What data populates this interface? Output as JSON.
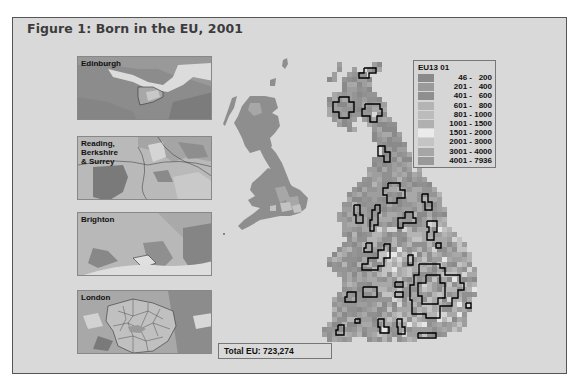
{
  "figure": {
    "title": "Figure 1: Born in the EU, 2001"
  },
  "insets": [
    {
      "label": "Edinburgh",
      "top": 56
    },
    {
      "label": "Reading,\nBerkshire\n& Surrey",
      "top": 136
    },
    {
      "label": "Brighton",
      "top": 212
    },
    {
      "label": "London",
      "top": 290
    }
  ],
  "legend": {
    "title": "EU13 01",
    "classes": [
      {
        "label": "46 -   200",
        "color": "#8a8a8a"
      },
      {
        "label": "201 -   400",
        "color": "#9a9a9a"
      },
      {
        "label": "401 -   600",
        "color": "#8f8f8f"
      },
      {
        "label": "601 -   800",
        "color": "#b4b4b4"
      },
      {
        "label": "801 - 1000",
        "color": "#bcbcbc"
      },
      {
        "label": "1001 - 1500",
        "color": "#b0b0b0"
      },
      {
        "label": "1501 - 2000",
        "color": "#ebebeb"
      },
      {
        "label": "2001 - 3000",
        "color": "#c4c4c4"
      },
      {
        "label": "3001 - 4000",
        "color": "#a6a6a6"
      },
      {
        "label": "4001 - 7936",
        "color": "#999999"
      }
    ]
  },
  "total": {
    "label": "Total EU: 723,274"
  },
  "cartogram": {
    "cell": 5,
    "rows": [
      [
        62,
        337,
        342
      ],
      [
        62,
        372,
        382
      ],
      [
        67,
        337,
        342
      ],
      [
        67,
        352,
        357
      ],
      [
        67,
        367,
        382
      ],
      [
        72,
        332,
        337
      ],
      [
        72,
        347,
        367
      ],
      [
        77,
        327,
        337
      ],
      [
        77,
        342,
        372
      ],
      [
        82,
        342,
        372
      ],
      [
        87,
        342,
        372
      ],
      [
        92,
        332,
        377
      ],
      [
        97,
        327,
        382
      ],
      [
        102,
        327,
        387
      ],
      [
        107,
        327,
        387
      ],
      [
        112,
        327,
        372
      ],
      [
        112,
        377,
        387
      ],
      [
        117,
        332,
        357
      ],
      [
        117,
        362,
        392
      ],
      [
        122,
        337,
        352
      ],
      [
        122,
        367,
        397
      ],
      [
        127,
        347,
        357
      ],
      [
        127,
        372,
        397
      ],
      [
        132,
        372,
        402
      ],
      [
        137,
        372,
        402
      ],
      [
        142,
        377,
        407
      ],
      [
        147,
        382,
        407
      ],
      [
        152,
        382,
        412
      ],
      [
        157,
        372,
        412
      ],
      [
        162,
        372,
        412
      ],
      [
        167,
        367,
        412
      ],
      [
        167,
        417,
        422
      ],
      [
        172,
        367,
        422
      ],
      [
        177,
        362,
        427
      ],
      [
        182,
        357,
        432
      ],
      [
        187,
        352,
        437
      ],
      [
        192,
        347,
        442
      ],
      [
        197,
        347,
        442
      ],
      [
        202,
        342,
        442
      ],
      [
        207,
        342,
        447
      ],
      [
        212,
        337,
        447
      ],
      [
        217,
        337,
        447
      ],
      [
        222,
        342,
        447
      ],
      [
        227,
        342,
        452
      ],
      [
        232,
        342,
        457
      ],
      [
        237,
        347,
        462
      ],
      [
        242,
        342,
        467
      ],
      [
        247,
        337,
        467
      ],
      [
        252,
        332,
        472
      ],
      [
        257,
        327,
        472
      ],
      [
        262,
        327,
        472
      ],
      [
        267,
        332,
        477
      ],
      [
        272,
        337,
        477
      ],
      [
        277,
        342,
        477
      ],
      [
        282,
        342,
        477
      ],
      [
        287,
        342,
        477
      ],
      [
        292,
        337,
        477
      ],
      [
        297,
        332,
        472
      ],
      [
        302,
        332,
        472
      ],
      [
        307,
        332,
        472
      ],
      [
        312,
        332,
        467
      ],
      [
        317,
        332,
        467
      ],
      [
        322,
        327,
        467
      ],
      [
        327,
        322,
        462
      ],
      [
        332,
        322,
        447
      ],
      [
        337,
        327,
        352
      ],
      [
        337,
        367,
        417
      ]
    ],
    "outlines": [
      [
        [
          364,
          68
        ],
        [
          376,
          68
        ],
        [
          376,
          73
        ],
        [
          369,
          73
        ],
        [
          369,
          78
        ],
        [
          359,
          78
        ],
        [
          359,
          73
        ],
        [
          364,
          73
        ],
        [
          364,
          68
        ]
      ],
      [
        [
          339,
          97
        ],
        [
          349,
          97
        ],
        [
          349,
          102
        ],
        [
          354,
          102
        ],
        [
          354,
          112
        ],
        [
          349,
          112
        ],
        [
          349,
          118
        ],
        [
          339,
          118
        ],
        [
          339,
          112
        ],
        [
          333,
          112
        ],
        [
          333,
          102
        ],
        [
          339,
          102
        ],
        [
          339,
          97
        ]
      ],
      [
        [
          365,
          104
        ],
        [
          380,
          104
        ],
        [
          380,
          109
        ],
        [
          382,
          109
        ],
        [
          382,
          116
        ],
        [
          377,
          116
        ],
        [
          377,
          122
        ],
        [
          370,
          122
        ],
        [
          370,
          116
        ],
        [
          362,
          116
        ],
        [
          362,
          109
        ],
        [
          365,
          109
        ],
        [
          365,
          104
        ]
      ],
      [
        [
          378,
          146
        ],
        [
          385,
          146
        ],
        [
          385,
          152
        ],
        [
          390,
          152
        ],
        [
          390,
          162
        ],
        [
          384,
          162
        ],
        [
          384,
          156
        ],
        [
          378,
          156
        ],
        [
          378,
          146
        ]
      ],
      [
        [
          388,
          183
        ],
        [
          400,
          183
        ],
        [
          400,
          190
        ],
        [
          405,
          190
        ],
        [
          405,
          198
        ],
        [
          397,
          198
        ],
        [
          397,
          203
        ],
        [
          387,
          203
        ],
        [
          387,
          195
        ],
        [
          383,
          195
        ],
        [
          383,
          188
        ],
        [
          388,
          188
        ],
        [
          388,
          183
        ]
      ],
      [
        [
          422,
          194
        ],
        [
          428,
          194
        ],
        [
          428,
          202
        ],
        [
          432,
          202
        ],
        [
          432,
          210
        ],
        [
          425,
          210
        ],
        [
          425,
          202
        ],
        [
          422,
          202
        ],
        [
          422,
          194
        ]
      ],
      [
        [
          354,
          205
        ],
        [
          360,
          205
        ],
        [
          360,
          215
        ],
        [
          363,
          215
        ],
        [
          363,
          223
        ],
        [
          356,
          223
        ],
        [
          356,
          215
        ],
        [
          354,
          215
        ],
        [
          354,
          205
        ]
      ],
      [
        [
          375,
          205
        ],
        [
          380,
          205
        ],
        [
          380,
          213
        ],
        [
          378,
          213
        ],
        [
          378,
          225
        ],
        [
          374,
          225
        ],
        [
          374,
          231
        ],
        [
          370,
          231
        ],
        [
          370,
          220
        ],
        [
          372,
          220
        ],
        [
          372,
          210
        ],
        [
          375,
          210
        ],
        [
          375,
          205
        ]
      ],
      [
        [
          405,
          212
        ],
        [
          413,
          212
        ],
        [
          413,
          218
        ],
        [
          416,
          218
        ],
        [
          416,
          223
        ],
        [
          403,
          223
        ],
        [
          403,
          228
        ],
        [
          398,
          228
        ],
        [
          398,
          218
        ],
        [
          405,
          218
        ],
        [
          405,
          212
        ]
      ],
      [
        [
          427,
          221
        ],
        [
          437,
          221
        ],
        [
          437,
          232
        ],
        [
          434,
          232
        ],
        [
          434,
          240
        ],
        [
          427,
          240
        ],
        [
          427,
          232
        ],
        [
          429,
          232
        ],
        [
          429,
          227
        ],
        [
          427,
          227
        ],
        [
          427,
          221
        ]
      ],
      [
        [
          436,
          243
        ],
        [
          441,
          243
        ],
        [
          441,
          248
        ],
        [
          436,
          248
        ],
        [
          436,
          243
        ]
      ],
      [
        [
          366,
          243
        ],
        [
          372,
          243
        ],
        [
          372,
          252
        ],
        [
          364,
          252
        ],
        [
          364,
          248
        ],
        [
          366,
          248
        ],
        [
          366,
          243
        ]
      ],
      [
        [
          384,
          244
        ],
        [
          390,
          244
        ],
        [
          390,
          258
        ],
        [
          384,
          258
        ],
        [
          384,
          266
        ],
        [
          378,
          266
        ],
        [
          378,
          270
        ],
        [
          362,
          270
        ],
        [
          362,
          264
        ],
        [
          368,
          264
        ],
        [
          368,
          258
        ],
        [
          378,
          258
        ],
        [
          378,
          250
        ],
        [
          384,
          250
        ],
        [
          384,
          244
        ]
      ],
      [
        [
          408,
          255
        ],
        [
          413,
          255
        ],
        [
          413,
          265
        ],
        [
          408,
          265
        ],
        [
          408,
          255
        ]
      ],
      [
        [
          419,
          264
        ],
        [
          440,
          264
        ],
        [
          440,
          268
        ],
        [
          445,
          268
        ],
        [
          445,
          275
        ],
        [
          460,
          275
        ],
        [
          460,
          283
        ],
        [
          464,
          283
        ],
        [
          464,
          290
        ],
        [
          458,
          290
        ],
        [
          458,
          298
        ],
        [
          452,
          298
        ],
        [
          452,
          306
        ],
        [
          440,
          306
        ],
        [
          440,
          318
        ],
        [
          426,
          318
        ],
        [
          426,
          314
        ],
        [
          412,
          314
        ],
        [
          412,
          300
        ],
        [
          410,
          300
        ],
        [
          410,
          285
        ],
        [
          414,
          285
        ],
        [
          414,
          275
        ],
        [
          419,
          275
        ],
        [
          419,
          264
        ]
      ],
      [
        [
          426,
          275
        ],
        [
          440,
          275
        ],
        [
          440,
          283
        ],
        [
          445,
          283
        ],
        [
          445,
          298
        ],
        [
          438,
          298
        ],
        [
          438,
          304
        ],
        [
          422,
          304
        ],
        [
          422,
          296
        ],
        [
          418,
          296
        ],
        [
          418,
          283
        ],
        [
          426,
          283
        ],
        [
          426,
          275
        ]
      ],
      [
        [
          363,
          287
        ],
        [
          377,
          287
        ],
        [
          377,
          297
        ],
        [
          363,
          297
        ],
        [
          363,
          287
        ]
      ],
      [
        [
          395,
          282
        ],
        [
          403,
          282
        ],
        [
          403,
          287
        ],
        [
          395,
          287
        ],
        [
          395,
          282
        ]
      ],
      [
        [
          395,
          292
        ],
        [
          403,
          292
        ],
        [
          403,
          297
        ],
        [
          395,
          297
        ],
        [
          395,
          292
        ]
      ],
      [
        [
          347,
          292
        ],
        [
          356,
          292
        ],
        [
          356,
          302
        ],
        [
          345,
          302
        ],
        [
          345,
          297
        ],
        [
          347,
          297
        ],
        [
          347,
          292
        ]
      ],
      [
        [
          466,
          303
        ],
        [
          471,
          303
        ],
        [
          471,
          308
        ],
        [
          466,
          308
        ],
        [
          466,
          303
        ]
      ],
      [
        [
          355,
          319
        ],
        [
          360,
          319
        ],
        [
          360,
          323
        ],
        [
          355,
          323
        ],
        [
          355,
          319
        ]
      ],
      [
        [
          378,
          319
        ],
        [
          384,
          319
        ],
        [
          384,
          327
        ],
        [
          389,
          327
        ],
        [
          389,
          333
        ],
        [
          380,
          333
        ],
        [
          380,
          327
        ],
        [
          378,
          327
        ],
        [
          378,
          319
        ]
      ],
      [
        [
          397,
          319
        ],
        [
          402,
          319
        ],
        [
          402,
          327
        ],
        [
          405,
          327
        ],
        [
          405,
          334
        ],
        [
          398,
          334
        ],
        [
          398,
          327
        ],
        [
          397,
          327
        ],
        [
          397,
          319
        ]
      ],
      [
        [
          338,
          325
        ],
        [
          344,
          325
        ],
        [
          344,
          335
        ],
        [
          336,
          335
        ],
        [
          336,
          330
        ],
        [
          338,
          330
        ],
        [
          338,
          325
        ]
      ],
      [
        [
          418,
          333
        ],
        [
          436,
          333
        ],
        [
          436,
          338
        ],
        [
          418,
          338
        ],
        [
          418,
          333
        ]
      ]
    ]
  }
}
